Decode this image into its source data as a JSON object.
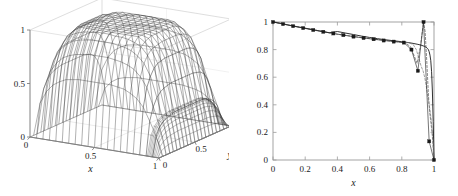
{
  "figure": {
    "background": "#ffffff",
    "panels": [
      "surface-plot",
      "line-plot"
    ]
  },
  "surface_panel": {
    "name": "3d-surface-plot",
    "xlabel": "x",
    "ylabel": "y",
    "zlabel": "",
    "x_ticks": [
      "0",
      "0.5",
      "1"
    ],
    "y_ticks": [
      "0",
      "0.5",
      "1"
    ],
    "z_ticks": [
      "0",
      "0.5",
      "1"
    ],
    "mesh_color": "#333333",
    "box_color": "#c8c8c8",
    "axis_color": "#808080"
  },
  "chart_data": [
    {
      "type": "surface",
      "name": "3d-mesh-surface",
      "title": "",
      "xlabel": "x",
      "ylabel": "y",
      "zlabel": "",
      "xlim": [
        0,
        1
      ],
      "ylim": [
        0,
        1
      ],
      "zlim": [
        0,
        1
      ],
      "x_ticks": [
        0,
        0.5,
        1
      ],
      "y_ticks": [
        0,
        0.5,
        1
      ],
      "z_ticks": [
        0,
        0.5,
        1
      ],
      "grid": true,
      "description": "Mesh surface: smooth ridge, value near 1 over most of domain, sharp boundary layer drop to 0 near x=1",
      "nx": 21,
      "ny": 21,
      "surface_z": [
        [
          0,
          0,
          0,
          0,
          0,
          0,
          0,
          0,
          0,
          0,
          0,
          0,
          0,
          0,
          0,
          0,
          0,
          0,
          0,
          0,
          0
        ],
        [
          0,
          0.31,
          0.43,
          0.5,
          0.54,
          0.57,
          0.58,
          0.59,
          0.59,
          0.59,
          0.59,
          0.59,
          0.59,
          0.58,
          0.57,
          0.54,
          0.5,
          0.43,
          0.31,
          0.18,
          0
        ],
        [
          0,
          0.43,
          0.6,
          0.69,
          0.75,
          0.78,
          0.8,
          0.81,
          0.82,
          0.82,
          0.82,
          0.82,
          0.81,
          0.8,
          0.78,
          0.75,
          0.69,
          0.6,
          0.43,
          0.25,
          0
        ],
        [
          0,
          0.5,
          0.69,
          0.8,
          0.86,
          0.9,
          0.92,
          0.93,
          0.94,
          0.94,
          0.94,
          0.94,
          0.93,
          0.92,
          0.9,
          0.86,
          0.8,
          0.69,
          0.5,
          0.29,
          0
        ],
        [
          0,
          0.54,
          0.75,
          0.86,
          0.93,
          0.96,
          0.98,
          0.99,
          1,
          1,
          1,
          0.99,
          0.99,
          0.98,
          0.96,
          0.93,
          0.86,
          0.75,
          0.54,
          0.31,
          0
        ],
        [
          0,
          0.56,
          0.78,
          0.9,
          0.96,
          1,
          1.01,
          1.02,
          1.03,
          1.03,
          1.03,
          1.02,
          1.02,
          1.01,
          1,
          0.96,
          0.9,
          0.78,
          0.56,
          0.32,
          0
        ],
        [
          0,
          0.57,
          0.79,
          0.91,
          0.98,
          1.01,
          1.03,
          1.04,
          1.05,
          1.05,
          1.05,
          1.04,
          1.04,
          1.03,
          1.01,
          0.98,
          0.91,
          0.79,
          0.57,
          0.33,
          0
        ],
        [
          0,
          0.58,
          0.8,
          0.92,
          0.99,
          1.02,
          1.04,
          1.05,
          1.06,
          1.06,
          1.06,
          1.05,
          1.05,
          1.04,
          1.02,
          0.99,
          0.92,
          0.8,
          0.58,
          0.33,
          0
        ],
        [
          0,
          0.58,
          0.8,
          0.93,
          0.99,
          1.03,
          1.05,
          1.06,
          1.06,
          1.07,
          1.06,
          1.06,
          1.05,
          1.05,
          1.03,
          0.99,
          0.93,
          0.8,
          0.58,
          0.33,
          0
        ],
        [
          0,
          0.58,
          0.8,
          0.93,
          0.99,
          1.03,
          1.05,
          1.06,
          1.07,
          1.07,
          1.07,
          1.06,
          1.06,
          1.05,
          1.03,
          0.99,
          0.93,
          0.8,
          0.58,
          0.33,
          0
        ],
        [
          0,
          0.58,
          0.8,
          0.93,
          0.99,
          1.03,
          1.05,
          1.06,
          1.07,
          1.07,
          1.07,
          1.06,
          1.06,
          1.05,
          1.03,
          0.99,
          0.93,
          0.8,
          0.58,
          0.33,
          0
        ],
        [
          0,
          0.58,
          0.8,
          0.93,
          0.99,
          1.03,
          1.05,
          1.06,
          1.07,
          1.07,
          1.07,
          1.06,
          1.06,
          1.05,
          1.03,
          0.99,
          0.93,
          0.8,
          0.58,
          0.33,
          0
        ],
        [
          0,
          0.58,
          0.8,
          0.93,
          0.99,
          1.03,
          1.05,
          1.06,
          1.06,
          1.07,
          1.06,
          1.06,
          1.05,
          1.05,
          1.03,
          0.99,
          0.93,
          0.8,
          0.58,
          0.33,
          0
        ],
        [
          0,
          0.58,
          0.8,
          0.92,
          0.99,
          1.02,
          1.04,
          1.05,
          1.06,
          1.06,
          1.06,
          1.05,
          1.05,
          1.04,
          1.02,
          0.99,
          0.92,
          0.8,
          0.58,
          0.33,
          0
        ],
        [
          0,
          0.57,
          0.79,
          0.91,
          0.97,
          1.01,
          1.03,
          1.04,
          1.05,
          1.05,
          1.05,
          1.04,
          1.04,
          1.03,
          1.01,
          0.97,
          0.91,
          0.79,
          0.57,
          0.33,
          0
        ],
        [
          0,
          0.56,
          0.77,
          0.89,
          0.95,
          0.99,
          1,
          1.01,
          1.02,
          1.02,
          1.02,
          1.01,
          1.01,
          1,
          0.99,
          0.95,
          0.89,
          0.77,
          0.56,
          0.32,
          0
        ],
        [
          0,
          0.53,
          0.73,
          0.85,
          0.91,
          0.94,
          0.96,
          0.97,
          0.98,
          0.98,
          0.98,
          0.97,
          0.97,
          0.96,
          0.94,
          0.91,
          0.85,
          0.73,
          0.53,
          0.3,
          0
        ],
        [
          0,
          0.47,
          0.65,
          0.75,
          0.8,
          0.84,
          0.85,
          0.86,
          0.87,
          0.87,
          0.87,
          0.86,
          0.86,
          0.85,
          0.84,
          0.8,
          0.75,
          0.65,
          0.47,
          0.27,
          0
        ],
        [
          0,
          0.36,
          0.49,
          0.57,
          0.61,
          0.64,
          0.65,
          0.66,
          0.66,
          0.66,
          0.66,
          0.66,
          0.66,
          0.65,
          0.64,
          0.61,
          0.57,
          0.49,
          0.36,
          0.21,
          0
        ],
        [
          0,
          0.18,
          0.25,
          0.29,
          0.31,
          0.32,
          0.33,
          0.33,
          0.33,
          0.33,
          0.33,
          0.33,
          0.33,
          0.33,
          0.32,
          0.31,
          0.29,
          0.25,
          0.18,
          0.1,
          0
        ],
        [
          0,
          0,
          0,
          0,
          0,
          0,
          0,
          0,
          0,
          0,
          0,
          0,
          0,
          0,
          0,
          0,
          0,
          0,
          0,
          0,
          0
        ]
      ]
    },
    {
      "type": "line",
      "name": "cross-section-line-plot",
      "title": "",
      "xlabel": "x",
      "ylabel": "",
      "xlim": [
        0,
        1
      ],
      "ylim": [
        0,
        1
      ],
      "x_ticks": [
        0,
        0.2,
        0.4,
        0.6,
        0.8,
        1
      ],
      "x_tick_labels": [
        "0",
        "0.2",
        "0.4",
        "0.6",
        "0.8",
        "1"
      ],
      "y_ticks": [
        0,
        0.2,
        0.4,
        0.6,
        0.8,
        1
      ],
      "y_tick_labels": [
        "0",
        "0.2",
        "0.4",
        "0.6",
        "0.8",
        "1"
      ],
      "grid": false,
      "legend": null,
      "series": [
        {
          "name": "exact-solution",
          "style": "solid",
          "color": "#1a1a1a",
          "marker": "none",
          "x": [
            0,
            0.05,
            0.1,
            0.15,
            0.2,
            0.25,
            0.3,
            0.35,
            0.4,
            0.45,
            0.5,
            0.55,
            0.6,
            0.65,
            0.7,
            0.75,
            0.8,
            0.84,
            0.87,
            0.9,
            0.92,
            0.94,
            0.95,
            0.96,
            0.965,
            0.97,
            0.975,
            0.98,
            0.985,
            0.99,
            0.995,
            1
          ],
          "y": [
            1,
            0.99,
            0.977,
            0.966,
            0.955,
            0.944,
            0.933,
            0.922,
            0.931,
            0.92,
            0.909,
            0.898,
            0.888,
            0.879,
            0.871,
            0.864,
            0.857,
            0.851,
            0.845,
            0.838,
            0.832,
            0.824,
            0.818,
            0.808,
            0.8,
            0.785,
            0.76,
            0.72,
            0.64,
            0.5,
            0.28,
            0
          ]
        },
        {
          "name": "numerical-solution-markers",
          "style": "solid",
          "color": "#1a1a1a",
          "marker": "square-filled",
          "x": [
            0,
            0.0625,
            0.125,
            0.1875,
            0.25,
            0.3125,
            0.375,
            0.4375,
            0.5,
            0.5625,
            0.625,
            0.6875,
            0.75,
            0.8125,
            0.86,
            0.9,
            0.935,
            0.97,
            1.0
          ],
          "y": [
            1.0,
            0.985,
            0.97,
            0.956,
            0.942,
            0.929,
            0.917,
            0.905,
            0.894,
            0.884,
            0.875,
            0.866,
            0.858,
            0.851,
            0.8,
            0.646,
            1.0,
            0.135,
            0.0
          ]
        },
        {
          "name": "oscillatory-solution",
          "style": "dashed",
          "color": "#555555",
          "marker": "none",
          "x": [
            0,
            0.1,
            0.2,
            0.3,
            0.4,
            0.5,
            0.6,
            0.7,
            0.78,
            0.82,
            0.855,
            0.875,
            0.895,
            0.915,
            0.935,
            0.945,
            0.955,
            0.962,
            0.968,
            0.974,
            0.98,
            0.986,
            0.992,
            0.996,
            1
          ],
          "y": [
            1,
            0.977,
            0.955,
            0.933,
            0.911,
            0.895,
            0.88,
            0.866,
            0.856,
            0.851,
            0.82,
            0.76,
            0.7,
            0.82,
            1.0,
            0.93,
            0.72,
            0.55,
            0.42,
            0.34,
            0.28,
            0.22,
            0.14,
            0.07,
            0
          ]
        },
        {
          "name": "secondary-oscillatory-solution",
          "style": "dashed",
          "color": "#777777",
          "marker": "none",
          "x": [
            0.8,
            0.84,
            0.87,
            0.89,
            0.905,
            0.92,
            0.932,
            0.942,
            0.95,
            0.958,
            0.966,
            0.974,
            0.982,
            0.99,
            0.995,
            1
          ],
          "y": [
            0.857,
            0.85,
            0.838,
            0.8,
            0.74,
            0.68,
            0.646,
            0.6,
            0.55,
            0.49,
            0.43,
            0.37,
            0.3,
            0.2,
            0.11,
            0
          ]
        }
      ]
    }
  ],
  "line_panel": {
    "name": "2d-line-plot",
    "xlabel": "x",
    "x_tick_labels": [
      "0",
      "0.2",
      "0.4",
      "0.6",
      "0.8",
      "1"
    ],
    "y_tick_labels": [
      "0",
      "0.2",
      "0.4",
      "0.6",
      "0.8",
      "1"
    ],
    "axis_color": "#9a9a9a",
    "line_color": "#1a1a1a",
    "marker_color": "#1a1a1a",
    "dash_color": "#666666"
  }
}
